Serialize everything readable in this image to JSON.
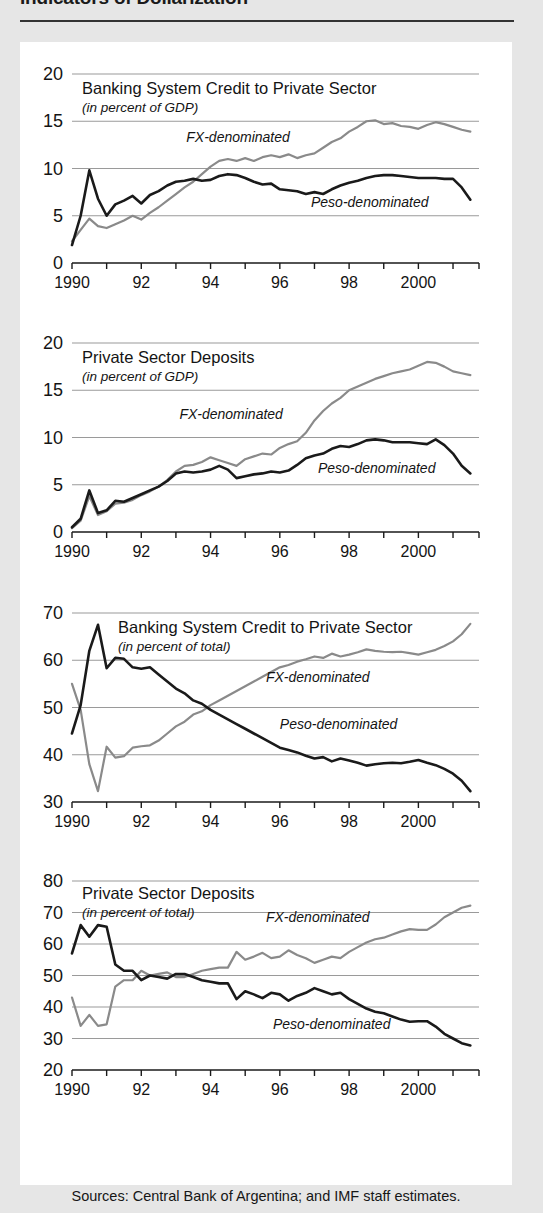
{
  "figure": {
    "title": "Indicators of Dollarization",
    "source_note": "Sources: Central Bank of Argentina; and IMF staff estimates."
  },
  "series_labels": {
    "fx": "FX-denominated",
    "peso": "Peso-denominated"
  },
  "colors": {
    "peso_line": "#1a1a1a",
    "fx_line": "#8a8a8a",
    "gridline": "#9a9a9a",
    "axis": "#1a1a1a",
    "card_background": "#ffffff",
    "page_background": "#e6e6e6"
  },
  "chart_data": [
    {
      "id": "credit-gdp",
      "type": "line",
      "title": "Banking System Credit to Private Sector",
      "subtitle": "(in percent of GDP)",
      "xlabel": "",
      "ylabel": "",
      "ylim": [
        0,
        20
      ],
      "yticks": [
        0,
        5,
        10,
        15,
        20
      ],
      "ytick_labels": [
        "0",
        "5",
        "10",
        "15",
        "20"
      ],
      "xlim": [
        1990,
        2001.75
      ],
      "xticks": [
        1990,
        1991,
        1992,
        1993,
        1994,
        1995,
        1996,
        1997,
        1998,
        1999,
        2000,
        2001
      ],
      "xtick_labels": [
        "1990",
        "",
        "92",
        "",
        "94",
        "",
        "96",
        "",
        "98",
        "",
        "2000",
        ""
      ],
      "grid": true,
      "x": [
        1990.0,
        1990.25,
        1990.5,
        1990.75,
        1991.0,
        1991.25,
        1991.5,
        1991.75,
        1992.0,
        1992.25,
        1992.5,
        1992.75,
        1993.0,
        1993.25,
        1993.5,
        1993.75,
        1994.0,
        1994.25,
        1994.5,
        1994.75,
        1995.0,
        1995.25,
        1995.5,
        1995.75,
        1996.0,
        1996.25,
        1996.5,
        1996.75,
        1997.0,
        1997.25,
        1997.5,
        1997.75,
        1998.0,
        1998.25,
        1998.5,
        1998.75,
        1999.0,
        1999.25,
        1999.5,
        1999.75,
        2000.0,
        2000.25,
        2000.5,
        2000.75,
        2001.0,
        2001.25,
        2001.5
      ],
      "series": [
        {
          "name": "Peso-denominated",
          "color": "#1a1a1a",
          "values": [
            1.9,
            5.0,
            9.8,
            6.8,
            5.0,
            6.2,
            6.6,
            7.1,
            6.3,
            7.2,
            7.6,
            8.2,
            8.6,
            8.7,
            8.9,
            8.7,
            8.8,
            9.2,
            9.4,
            9.3,
            9.0,
            8.6,
            8.3,
            8.4,
            7.8,
            7.7,
            7.6,
            7.3,
            7.5,
            7.3,
            7.8,
            8.2,
            8.5,
            8.7,
            9.0,
            9.2,
            9.3,
            9.3,
            9.2,
            9.1,
            9.0,
            9.0,
            9.0,
            8.9,
            8.9,
            8.0,
            6.7
          ]
        },
        {
          "name": "FX-denominated",
          "color": "#8a8a8a",
          "values": [
            2.3,
            3.5,
            4.7,
            3.9,
            3.7,
            4.1,
            4.5,
            5.0,
            4.6,
            5.3,
            5.9,
            6.6,
            7.3,
            8.0,
            8.6,
            9.4,
            10.2,
            10.8,
            11.0,
            10.8,
            11.1,
            10.8,
            11.2,
            11.4,
            11.2,
            11.5,
            11.1,
            11.4,
            11.6,
            12.2,
            12.8,
            13.2,
            13.9,
            14.4,
            15.0,
            15.1,
            14.7,
            14.8,
            14.5,
            14.4,
            14.2,
            14.6,
            14.9,
            14.7,
            14.4,
            14.1,
            13.9
          ]
        }
      ],
      "annotations": [
        {
          "text": "FX-denominated",
          "x": 1993.3,
          "y": 12.8
        },
        {
          "text": "Peso-denominated",
          "x": 1996.9,
          "y": 5.9
        }
      ]
    },
    {
      "id": "deposits-gdp",
      "type": "line",
      "title": "Private Sector Deposits",
      "subtitle": "(in percent of GDP)",
      "xlabel": "",
      "ylabel": "",
      "ylim": [
        0,
        20
      ],
      "yticks": [
        0,
        5,
        10,
        15,
        20
      ],
      "ytick_labels": [
        "0",
        "5",
        "10",
        "15",
        "20"
      ],
      "xlim": [
        1990,
        2001.75
      ],
      "xticks": [
        1990,
        1991,
        1992,
        1993,
        1994,
        1995,
        1996,
        1997,
        1998,
        1999,
        2000,
        2001
      ],
      "xtick_labels": [
        "1990",
        "",
        "92",
        "",
        "94",
        "",
        "96",
        "",
        "98",
        "",
        "2000",
        ""
      ],
      "grid": true,
      "x": [
        1990.0,
        1990.25,
        1990.5,
        1990.75,
        1991.0,
        1991.25,
        1991.5,
        1991.75,
        1992.0,
        1992.25,
        1992.5,
        1992.75,
        1993.0,
        1993.25,
        1993.5,
        1993.75,
        1994.0,
        1994.25,
        1994.5,
        1994.75,
        1995.0,
        1995.25,
        1995.5,
        1995.75,
        1996.0,
        1996.25,
        1996.5,
        1996.75,
        1997.0,
        1997.25,
        1997.5,
        1997.75,
        1998.0,
        1998.25,
        1998.5,
        1998.75,
        1999.0,
        1999.25,
        1999.5,
        1999.75,
        2000.0,
        2000.25,
        2000.5,
        2000.75,
        2001.0,
        2001.25,
        2001.5
      ],
      "series": [
        {
          "name": "Peso-denominated",
          "color": "#1a1a1a",
          "values": [
            0.5,
            1.4,
            4.4,
            2.0,
            2.3,
            3.3,
            3.2,
            3.6,
            4.0,
            4.4,
            4.8,
            5.4,
            6.2,
            6.4,
            6.3,
            6.4,
            6.6,
            7.0,
            6.6,
            5.7,
            5.9,
            6.1,
            6.2,
            6.4,
            6.3,
            6.5,
            7.1,
            7.8,
            8.1,
            8.3,
            8.8,
            9.1,
            9.0,
            9.3,
            9.7,
            9.8,
            9.7,
            9.5,
            9.5,
            9.5,
            9.4,
            9.3,
            9.8,
            9.2,
            8.3,
            7.0,
            6.2
          ]
        },
        {
          "name": "FX-denominated",
          "color": "#8a8a8a",
          "values": [
            0.4,
            1.2,
            3.8,
            1.8,
            2.2,
            3.0,
            3.1,
            3.4,
            3.9,
            4.3,
            4.8,
            5.5,
            6.4,
            7.0,
            7.1,
            7.4,
            7.9,
            7.6,
            7.3,
            7.0,
            7.7,
            8.0,
            8.3,
            8.2,
            8.9,
            9.3,
            9.6,
            10.5,
            11.8,
            12.8,
            13.6,
            14.2,
            15.0,
            15.4,
            15.8,
            16.2,
            16.5,
            16.8,
            17.0,
            17.2,
            17.6,
            18.0,
            17.9,
            17.5,
            17.0,
            16.8,
            16.6
          ]
        }
      ],
      "annotations": [
        {
          "text": "FX-denominated",
          "x": 1993.1,
          "y": 12.0
        },
        {
          "text": "Peso-denominated",
          "x": 1997.1,
          "y": 6.2
        }
      ]
    },
    {
      "id": "credit-total",
      "type": "line",
      "title": "Banking System Credit to Private Sector",
      "subtitle": "(in percent of total)",
      "xlabel": "",
      "ylabel": "",
      "ylim": [
        30,
        70
      ],
      "yticks": [
        30,
        40,
        50,
        60,
        70
      ],
      "ytick_labels": [
        "30",
        "40",
        "50",
        "60",
        "70"
      ],
      "xlim": [
        1990,
        2001.75
      ],
      "xticks": [
        1990,
        1991,
        1992,
        1993,
        1994,
        1995,
        1996,
        1997,
        1998,
        1999,
        2000,
        2001
      ],
      "xtick_labels": [
        "1990",
        "",
        "92",
        "",
        "94",
        "",
        "96",
        "",
        "98",
        "",
        "2000",
        ""
      ],
      "grid": true,
      "x": [
        1990.0,
        1990.25,
        1990.5,
        1990.75,
        1991.0,
        1991.25,
        1991.5,
        1991.75,
        1992.0,
        1992.25,
        1992.5,
        1992.75,
        1993.0,
        1993.25,
        1993.5,
        1993.75,
        1994.0,
        1994.25,
        1994.5,
        1994.75,
        1995.0,
        1995.25,
        1995.5,
        1995.75,
        1996.0,
        1996.25,
        1996.5,
        1996.75,
        1997.0,
        1997.25,
        1997.5,
        1997.75,
        1998.0,
        1998.25,
        1998.5,
        1998.75,
        1999.0,
        1999.25,
        1999.5,
        1999.75,
        2000.0,
        2000.25,
        2000.5,
        2000.75,
        2001.0,
        2001.25,
        2001.5
      ],
      "series": [
        {
          "name": "Peso-denominated",
          "color": "#1a1a1a",
          "values": [
            44.5,
            50.5,
            62.0,
            67.5,
            58.3,
            60.5,
            60.3,
            58.5,
            58.2,
            58.5,
            57.0,
            55.5,
            54.0,
            53.0,
            51.5,
            50.8,
            49.5,
            48.5,
            47.5,
            46.5,
            45.5,
            44.5,
            43.5,
            42.5,
            41.5,
            41.0,
            40.5,
            39.8,
            39.2,
            39.5,
            38.6,
            39.2,
            38.8,
            38.3,
            37.7,
            38.0,
            38.2,
            38.3,
            38.2,
            38.5,
            38.9,
            38.3,
            37.8,
            37.0,
            36.0,
            34.5,
            32.3
          ]
        },
        {
          "name": "FX-denominated",
          "color": "#8a8a8a",
          "values": [
            55.0,
            49.5,
            38.0,
            32.3,
            41.7,
            39.4,
            39.7,
            41.5,
            41.8,
            42.0,
            43.0,
            44.5,
            46.0,
            47.0,
            48.5,
            49.2,
            50.5,
            51.5,
            52.5,
            53.5,
            54.5,
            55.5,
            56.5,
            57.5,
            58.5,
            59.0,
            59.7,
            60.2,
            60.8,
            60.5,
            61.4,
            60.8,
            61.2,
            61.7,
            62.3,
            62.0,
            61.8,
            61.7,
            61.8,
            61.5,
            61.2,
            61.7,
            62.2,
            63.0,
            64.0,
            65.5,
            67.7
          ]
        }
      ],
      "annotations": [
        {
          "text": "FX-denominated",
          "x": 1995.6,
          "y": 55.5
        },
        {
          "text": "Peso-denominated",
          "x": 1996.0,
          "y": 45.5
        }
      ]
    },
    {
      "id": "deposits-total",
      "type": "line",
      "title": "Private Sector Deposits",
      "subtitle": "(in percent of total)",
      "xlabel": "",
      "ylabel": "",
      "ylim": [
        20,
        80
      ],
      "yticks": [
        20,
        30,
        40,
        50,
        60,
        70,
        80
      ],
      "ytick_labels": [
        "20",
        "30",
        "40",
        "50",
        "60",
        "70",
        "80"
      ],
      "xlim": [
        1990,
        2001.75
      ],
      "xticks": [
        1990,
        1991,
        1992,
        1993,
        1994,
        1995,
        1996,
        1997,
        1998,
        1999,
        2000,
        2001
      ],
      "xtick_labels": [
        "1990",
        "",
        "92",
        "",
        "94",
        "",
        "96",
        "",
        "98",
        "",
        "2000",
        ""
      ],
      "grid": true,
      "x": [
        1990.0,
        1990.25,
        1990.5,
        1990.75,
        1991.0,
        1991.25,
        1991.5,
        1991.75,
        1992.0,
        1992.25,
        1992.5,
        1992.75,
        1993.0,
        1993.25,
        1993.5,
        1993.75,
        1994.0,
        1994.25,
        1994.5,
        1994.75,
        1995.0,
        1995.25,
        1995.5,
        1995.75,
        1996.0,
        1996.25,
        1996.5,
        1996.75,
        1997.0,
        1997.25,
        1997.5,
        1997.75,
        1998.0,
        1998.25,
        1998.5,
        1998.75,
        1999.0,
        1999.25,
        1999.5,
        1999.75,
        2000.0,
        2000.25,
        2000.5,
        2000.75,
        2001.0,
        2001.25,
        2001.5
      ],
      "series": [
        {
          "name": "Peso-denominated",
          "color": "#1a1a1a",
          "values": [
            57.0,
            66.0,
            62.3,
            66.0,
            65.5,
            53.5,
            51.5,
            51.5,
            48.5,
            50.0,
            49.5,
            49.0,
            50.5,
            50.5,
            49.5,
            48.5,
            48.0,
            47.5,
            47.5,
            42.5,
            45.0,
            44.0,
            42.8,
            44.5,
            44.0,
            42.0,
            43.5,
            44.5,
            46.0,
            45.0,
            44.0,
            44.5,
            42.5,
            41.0,
            39.5,
            38.5,
            38.0,
            37.0,
            36.0,
            35.3,
            35.5,
            35.5,
            33.8,
            31.5,
            30.0,
            28.5,
            27.8
          ]
        },
        {
          "name": "FX-denominated",
          "color": "#8a8a8a",
          "values": [
            43.0,
            34.0,
            37.5,
            34.0,
            34.5,
            46.5,
            48.5,
            48.5,
            51.5,
            50.0,
            50.5,
            51.0,
            49.5,
            49.5,
            50.5,
            51.5,
            52.0,
            52.5,
            52.5,
            57.5,
            55.0,
            56.0,
            57.2,
            55.5,
            56.0,
            58.0,
            56.5,
            55.5,
            54.0,
            55.0,
            56.0,
            55.5,
            57.5,
            59.0,
            60.5,
            61.5,
            62.0,
            63.0,
            64.0,
            64.7,
            64.5,
            64.5,
            66.2,
            68.5,
            70.0,
            71.5,
            72.2
          ]
        }
      ],
      "annotations": [
        {
          "text": "FX-denominated",
          "x": 1995.6,
          "y": 67.0
        },
        {
          "text": "Peso-denominated",
          "x": 1995.8,
          "y": 33.0
        }
      ]
    }
  ]
}
